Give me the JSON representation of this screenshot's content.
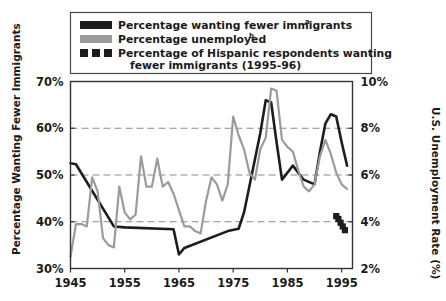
{
  "chart_data": {
    "type": "line",
    "title": "",
    "xlabel": "",
    "ylabel": "Percentage Wanting Fewer Immigrants",
    "y2label": "U.S. Unemployment Rate (%)",
    "xlim": [
      1945,
      1997
    ],
    "ylim": [
      30,
      70
    ],
    "y2lim": [
      2,
      10
    ],
    "grid": true,
    "gridlines_y": [
      40,
      50,
      60
    ],
    "legend_position": "top",
    "xticks": [
      1945,
      1955,
      1965,
      1975,
      1985,
      1995
    ],
    "xtick_labels": [
      "1945",
      "1955",
      "1965",
      "1975",
      "1985",
      "1995"
    ],
    "yticks": [
      30,
      40,
      50,
      60,
      70
    ],
    "ytick_labels": [
      "30%",
      "40%",
      "50%",
      "60%",
      "70%"
    ],
    "y2ticks": [
      2,
      4,
      6,
      8,
      10
    ],
    "y2tick_labels": [
      "2%",
      "4%",
      "6%",
      "8%",
      "10%"
    ],
    "series": [
      {
        "name": "Percentage wanting fewer immigrants",
        "name_superscript": "a",
        "color": "#1d1d1d",
        "style": "solid",
        "axis": "left",
        "x": [
          1945,
          1946,
          1953,
          1955,
          1964,
          1965,
          1966,
          1974,
          1976,
          1977,
          1980,
          1981,
          1982,
          1983,
          1984,
          1986,
          1988,
          1990,
          1991,
          1992,
          1993,
          1994,
          1995,
          1996
        ],
        "y": [
          52.5,
          52.3,
          39.0,
          38.8,
          38.4,
          33.0,
          34.4,
          38.0,
          38.5,
          42.0,
          59.0,
          66.0,
          65.5,
          57.0,
          49.0,
          52.0,
          49.0,
          48.0,
          55.0,
          61.0,
          63.0,
          62.5,
          57.0,
          52.0
        ]
      },
      {
        "name": "Percentage unemployed",
        "name_superscript": "b",
        "color": "#9b9b9b",
        "style": "solid",
        "axis": "right",
        "x": [
          1945,
          1946,
          1947,
          1948,
          1949,
          1950,
          1951,
          1952,
          1953,
          1954,
          1955,
          1956,
          1957,
          1958,
          1959,
          1960,
          1961,
          1962,
          1963,
          1964,
          1965,
          1966,
          1967,
          1968,
          1969,
          1970,
          1971,
          1972,
          1973,
          1974,
          1975,
          1976,
          1977,
          1978,
          1979,
          1980,
          1981,
          1982,
          1983,
          1984,
          1985,
          1986,
          1987,
          1988,
          1989,
          1990,
          1991,
          1992,
          1993,
          1994,
          1995,
          1996
        ],
        "y": [
          2.5,
          3.9,
          3.9,
          3.8,
          5.9,
          5.3,
          3.3,
          3.0,
          2.9,
          5.5,
          4.4,
          4.1,
          4.3,
          6.8,
          5.5,
          5.5,
          6.7,
          5.5,
          5.7,
          5.2,
          4.5,
          3.8,
          3.8,
          3.6,
          3.5,
          4.9,
          5.9,
          5.6,
          4.9,
          5.6,
          8.5,
          7.7,
          7.1,
          6.1,
          5.8,
          7.1,
          7.6,
          9.7,
          9.6,
          7.5,
          7.2,
          7.0,
          6.2,
          5.5,
          5.3,
          5.6,
          6.8,
          7.5,
          6.9,
          6.1,
          5.6,
          5.4
        ]
      },
      {
        "name": "Percentage of Hispanic respondents wanting fewer immigrants (1995-96)",
        "color": "#1d1d1d",
        "style": "dotted-markers",
        "axis": "left",
        "x": [
          1994.0,
          1994.4,
          1994.8,
          1995.2,
          1995.6
        ],
        "y": [
          41.2,
          40.6,
          39.8,
          39.0,
          38.2
        ]
      }
    ]
  },
  "legend": {
    "items": [
      {
        "swatch": "black-bar",
        "label": "Percentage wanting fewer immigrants",
        "superscript": "a"
      },
      {
        "swatch": "gray-bar",
        "label": "Percentage unemployed",
        "superscript": "b"
      },
      {
        "swatch": "dotted-squares",
        "label": "Percentage of Hispanic respondents wanting",
        "label_line2": "fewer immigrants (1995-96)",
        "superscript": ""
      }
    ]
  },
  "colors": {
    "black_series": "#1d1d1d",
    "gray_series": "#9b9b9b",
    "frame": "#333333",
    "grid": "#8a8a8a",
    "background": "#ffffff"
  }
}
